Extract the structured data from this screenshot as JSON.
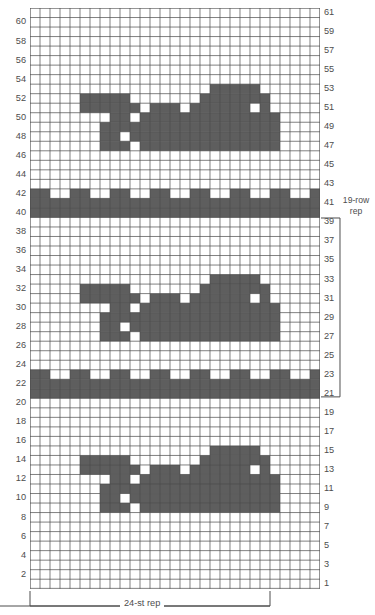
{
  "chart_data": {
    "type": "heatmap",
    "title": "",
    "subtitle": "",
    "xlabel": "24-st rep",
    "ylabel": "",
    "grid": true,
    "legend_position": "none",
    "columns": 29,
    "rows": 61,
    "cell_colors": {
      "filled": "#5e5e5e",
      "empty": "#ffffff",
      "gridline": "#4a4a4a"
    },
    "x": [
      1,
      2,
      3,
      4,
      5,
      6,
      7,
      8,
      9,
      10,
      11,
      12,
      13,
      14,
      15,
      16,
      17,
      18,
      19,
      20,
      21,
      22,
      23,
      24,
      25,
      26,
      27,
      28,
      29
    ],
    "y_left_ticks": [
      2,
      4,
      6,
      8,
      10,
      12,
      14,
      16,
      18,
      20,
      22,
      24,
      26,
      28,
      30,
      32,
      34,
      36,
      38,
      40,
      42,
      44,
      46,
      48,
      50,
      52,
      54,
      56,
      58,
      60
    ],
    "y_right_ticks": [
      1,
      3,
      5,
      7,
      9,
      11,
      13,
      15,
      17,
      19,
      21,
      23,
      25,
      27,
      29,
      31,
      33,
      35,
      37,
      39,
      41,
      43,
      45,
      47,
      49,
      51,
      53,
      55,
      57,
      59,
      61
    ],
    "ylim": [
      1,
      61
    ],
    "xlim": [
      1,
      29
    ],
    "annotations": [
      {
        "text": "19-row rep",
        "position": "right",
        "spans_rows": [
          21,
          39
        ]
      },
      {
        "text": "24-st rep",
        "position": "bottom",
        "spans_columns": [
          1,
          24
        ]
      }
    ],
    "filled_cells_by_row": {
      "53": [
        19,
        20,
        21,
        22,
        23
      ],
      "52": [
        6,
        7,
        8,
        9,
        10,
        18,
        19,
        20,
        21,
        22,
        23,
        24
      ],
      "51": [
        6,
        7,
        8,
        9,
        10,
        11,
        13,
        14,
        15,
        17,
        18,
        19,
        20,
        21,
        22,
        24
      ],
      "50": [
        9,
        10,
        12,
        13,
        14,
        15,
        16,
        17,
        18,
        19,
        20,
        21,
        22,
        23,
        24,
        25
      ],
      "49": [
        8,
        9,
        10,
        11,
        12,
        13,
        14,
        15,
        16,
        17,
        18,
        19,
        20,
        21,
        22,
        23,
        24,
        25
      ],
      "48": [
        8,
        9,
        11,
        12,
        13,
        14,
        15,
        16,
        17,
        18,
        19,
        20,
        21,
        22,
        23,
        24,
        25
      ],
      "47": [
        8,
        9,
        10,
        12,
        13,
        14,
        15,
        16,
        17,
        18,
        19,
        20,
        21,
        22,
        23,
        24,
        25
      ],
      "42": [
        1,
        2,
        5,
        6,
        9,
        10,
        13,
        14,
        17,
        18,
        21,
        22,
        25,
        26,
        29
      ],
      "41": [
        1,
        2,
        3,
        4,
        5,
        6,
        7,
        8,
        9,
        10,
        11,
        12,
        13,
        14,
        15,
        16,
        17,
        18,
        19,
        20,
        21,
        22,
        23,
        24,
        25,
        26,
        27,
        28,
        29
      ],
      "40": [
        1,
        2,
        3,
        4,
        5,
        6,
        7,
        8,
        9,
        10,
        11,
        12,
        13,
        14,
        15,
        16,
        17,
        18,
        19,
        20,
        21,
        22,
        23,
        24,
        25,
        26,
        27,
        28,
        29
      ],
      "33": [
        19,
        20,
        21,
        22,
        23
      ],
      "32": [
        6,
        7,
        8,
        9,
        10,
        18,
        19,
        20,
        21,
        22,
        23,
        24
      ],
      "31": [
        6,
        7,
        8,
        9,
        10,
        11,
        13,
        14,
        15,
        17,
        18,
        19,
        20,
        21,
        22,
        24
      ],
      "30": [
        9,
        10,
        12,
        13,
        14,
        15,
        16,
        17,
        18,
        19,
        20,
        21,
        22,
        23,
        24,
        25
      ],
      "29": [
        8,
        9,
        10,
        11,
        12,
        13,
        14,
        15,
        16,
        17,
        18,
        19,
        20,
        21,
        22,
        23,
        24,
        25
      ],
      "28": [
        8,
        9,
        11,
        12,
        13,
        14,
        15,
        16,
        17,
        18,
        19,
        20,
        21,
        22,
        23,
        24,
        25
      ],
      "27": [
        8,
        9,
        10,
        12,
        13,
        14,
        15,
        16,
        17,
        18,
        19,
        20,
        21,
        22,
        23,
        24,
        25
      ],
      "23": [
        1,
        2,
        5,
        6,
        9,
        10,
        13,
        14,
        17,
        18,
        21,
        22,
        25,
        26,
        29
      ],
      "22": [
        1,
        2,
        3,
        4,
        5,
        6,
        7,
        8,
        9,
        10,
        11,
        12,
        13,
        14,
        15,
        16,
        17,
        18,
        19,
        20,
        21,
        22,
        23,
        24,
        25,
        26,
        27,
        28,
        29
      ],
      "21": [
        1,
        2,
        3,
        4,
        5,
        6,
        7,
        8,
        9,
        10,
        11,
        12,
        13,
        14,
        15,
        16,
        17,
        18,
        19,
        20,
        21,
        22,
        23,
        24,
        25,
        26,
        27,
        28,
        29
      ],
      "15": [
        19,
        20,
        21,
        22,
        23
      ],
      "14": [
        6,
        7,
        8,
        9,
        10,
        18,
        19,
        20,
        21,
        22,
        23,
        24
      ],
      "13": [
        6,
        7,
        8,
        9,
        10,
        11,
        13,
        14,
        15,
        17,
        18,
        19,
        20,
        21,
        22,
        24
      ],
      "12": [
        9,
        10,
        12,
        13,
        14,
        15,
        16,
        17,
        18,
        19,
        20,
        21,
        22,
        23,
        24,
        25
      ],
      "11": [
        8,
        9,
        10,
        11,
        12,
        13,
        14,
        15,
        16,
        17,
        18,
        19,
        20,
        21,
        22,
        23,
        24,
        25
      ],
      "10": [
        8,
        9,
        11,
        12,
        13,
        14,
        15,
        16,
        17,
        18,
        19,
        20,
        21,
        22,
        23,
        24,
        25
      ],
      "9": [
        8,
        9,
        10,
        12,
        13,
        14,
        15,
        16,
        17,
        18,
        19,
        20,
        21,
        22,
        23,
        24,
        25
      ]
    }
  },
  "axes": {
    "left_labels": [
      "60",
      "58",
      "56",
      "54",
      "52",
      "50",
      "48",
      "46",
      "44",
      "42",
      "40",
      "38",
      "36",
      "34",
      "32",
      "30",
      "28",
      "26",
      "24",
      "22",
      "20",
      "18",
      "16",
      "14",
      "12",
      "10",
      "8",
      "6",
      "4",
      "2"
    ],
    "right_labels": [
      "61",
      "59",
      "57",
      "55",
      "53",
      "51",
      "49",
      "47",
      "45",
      "43",
      "41",
      "39",
      "37",
      "35",
      "33",
      "31",
      "29",
      "27",
      "25",
      "23",
      "21",
      "19",
      "17",
      "15",
      "13",
      "11",
      "9",
      "7",
      "5",
      "3",
      "1"
    ]
  },
  "labels": {
    "row_rep_line1": "19-row",
    "row_rep_line2": "rep",
    "st_rep": "24-st rep"
  }
}
